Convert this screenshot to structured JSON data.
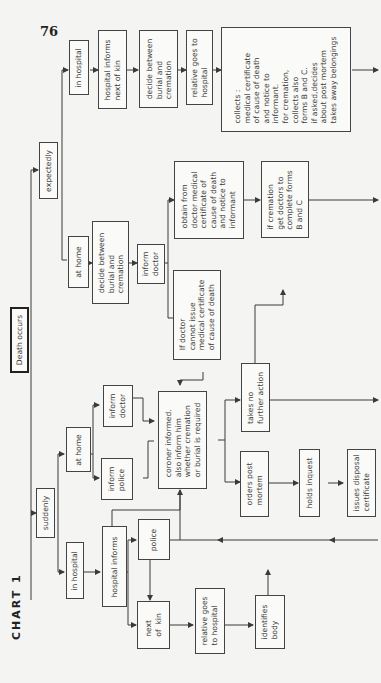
{
  "page": {
    "number": "76",
    "chart_title": "CHART 1"
  },
  "nodes": {
    "death_occurs": "Death occurs",
    "expectedly": "expectedly",
    "suddenly": "suddenly",
    "exp_in_hospital": "in hospital",
    "exp_hospital_informs": "hospital informs\nnext of kin",
    "exp_decide_hospital": "decide between\nburial and\ncremation",
    "exp_relative_goes": "relative goes to\nhospital",
    "exp_collects": "collects :\nmedical certificate\nof cause of death\nand notice to\ninformant.\nfor cremation,\ncollects also\nforms B and C.\nif asked,decides\nabout post mortem\ntakes away belongings",
    "exp_at_home": "at home",
    "exp_decide_home": "decide between\nburial and\ncremation",
    "exp_inform_doctor": "inform\ndoctor",
    "exp_obtain": "obtain from\ndoctor medical\ncertificate of\ncause of death\nand notice to\ninformant",
    "exp_if_cremation": "if cremation\nget doctors to\ncomplete forms\nB and C",
    "exp_doctor_cannot": "If doctor\ncannot issue\nmedical certificate\nof cause of death",
    "sud_at_home": "at home",
    "sud_inform_doctor": "inform\ndoctor",
    "sud_inform_police": "inform\npolice",
    "coroner": "coroner informed.\nalso inform him\nwhether cremation\nor burial is required",
    "takes_no_action": "takes no\nfurther action",
    "orders_pm": "orders post\nmortem",
    "holds_inquest": "holds inquest",
    "issues_disposal": "issues disposal\ncertificate",
    "sud_in_hospital": "in hospital",
    "sud_hospital_informs": "hospital informs",
    "police": "police",
    "next_of_kin": "next\nof  kin",
    "relative_goes_hospital": "relative goes\nto hospital",
    "identifies_body": "identifies\nbody"
  },
  "colors": {
    "line": "#3a3a3a",
    "paper": "#f4f4f2"
  }
}
